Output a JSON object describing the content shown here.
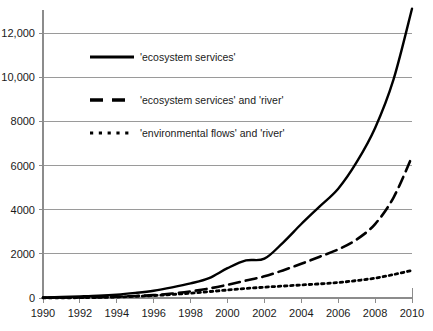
{
  "chart_data": {
    "type": "line",
    "title": "",
    "subtitle": "",
    "xlabel": "",
    "ylabel": "",
    "xlim": [
      1990,
      2010
    ],
    "ylim": [
      0,
      13400
    ],
    "grid": true,
    "legend_position": "upper-left-inside",
    "x_tick_labels": [
      "1990",
      "1992",
      "1994",
      "1996",
      "1998",
      "2000",
      "2002",
      "2004",
      "2006",
      "2008",
      "2010"
    ],
    "x_ticks": [
      1990,
      1992,
      1994,
      1996,
      1998,
      2000,
      2002,
      2004,
      2006,
      2008,
      2010
    ],
    "y_tick_labels": [
      "0",
      "2000",
      "4000",
      "6000",
      "8000",
      "10,000",
      "12,000"
    ],
    "y_ticks": [
      0,
      2000,
      4000,
      6000,
      8000,
      10000,
      12000
    ],
    "x": [
      1990,
      1991,
      1992,
      1993,
      1994,
      1995,
      1996,
      1997,
      1998,
      1999,
      2000,
      2001,
      2002,
      2003,
      2004,
      2005,
      2006,
      2007,
      2008,
      2009,
      2010
    ],
    "series": [
      {
        "name": "'ecosystem services'",
        "style": "solid",
        "color": "#000000",
        "values": [
          30,
          45,
          70,
          100,
          150,
          230,
          330,
          480,
          660,
          900,
          1350,
          1700,
          1780,
          2500,
          3350,
          4150,
          4950,
          6150,
          7700,
          9900,
          13100
        ]
      },
      {
        "name": "'ecosystem services' and 'river'",
        "style": "dashed",
        "color": "#000000",
        "values": [
          10,
          15,
          25,
          40,
          60,
          90,
          130,
          200,
          300,
          430,
          600,
          790,
          980,
          1250,
          1550,
          1870,
          2200,
          2650,
          3350,
          4550,
          6400
        ]
      },
      {
        "name": "'environmental flows' and 'river'",
        "style": "dotted",
        "color": "#000000",
        "values": [
          5,
          8,
          15,
          25,
          45,
          75,
          110,
          160,
          220,
          290,
          360,
          430,
          490,
          540,
          590,
          640,
          700,
          790,
          900,
          1060,
          1250
        ]
      }
    ],
    "legend": [
      {
        "label": "'ecosystem services'",
        "style": "solid"
      },
      {
        "label": "'ecosystem services' and 'river'",
        "style": "dashed"
      },
      {
        "label": "'environmental flows' and 'river'",
        "style": "dotted"
      }
    ]
  }
}
